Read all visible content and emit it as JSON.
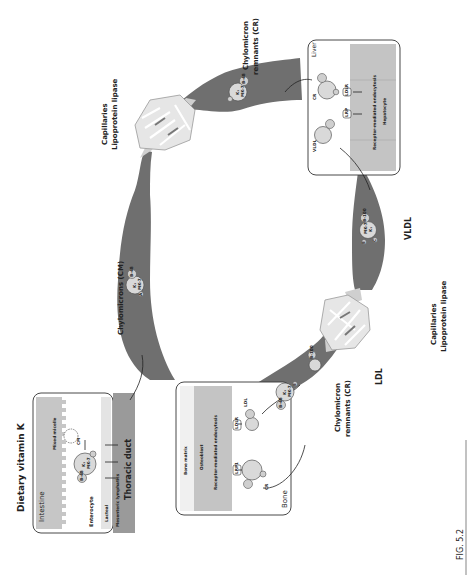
{
  "figure": {
    "caption": "FIG. 5.2",
    "orientation": "rotated 90 degrees counter-clockwise"
  },
  "labels": {
    "dietary": "Dietary vitamin K",
    "intestine": "Intestine",
    "mixed_micelle": "Mixed micelle",
    "cm_small": "CM",
    "enterocyte": "Enterocyte",
    "lacteal": "Lacteal",
    "mesenteric": "Mesenteric lymphatics",
    "thoracic": "Thoracic duct",
    "chylomicrons": "Chylomicrons (CM)",
    "capillaries_top": "Capillaries",
    "lpl_top": "Lipoprotein lipase",
    "cr_top_1": "Chylomicron",
    "cr_top_2": "remnants (CR)",
    "liver": "Liver",
    "liver_cr": "CR",
    "liver_vldl": "VLDL",
    "liver_rme": "Receptor-mediated endocytosis",
    "hepatocyte": "Hepatocyte",
    "lrp": "LRP",
    "ldlr": "LDLR",
    "vldl": "VLDL",
    "capillaries_bottom": "Capillaries",
    "lpl_bottom": "Lipoprotein lipase",
    "ldl": "LDL",
    "cr_bottom_1": "Chylomicron",
    "cr_bottom_2": "remnants (CR)",
    "bone": "Bone",
    "bone_matrix": "Bone matrix",
    "osteoblast": "Osteoblast",
    "bone_rme": "Receptor-mediated endocytosis",
    "bone_cr": "CR",
    "bone_ldl": "LDL",
    "bone_lrp": "LRP1",
    "bone_ldlr": "LDLR"
  },
  "particles": {
    "k1": "K₁",
    "mk7": "MK-7",
    "b48": "B-48",
    "b100": "B-100",
    "a": "A",
    "e": "E",
    "c": "C"
  },
  "colors": {
    "vessel": "#6f6f6f",
    "capillary": "#d8d8d8",
    "cell": "#c4c4c4",
    "particle": "#d9d9d9"
  }
}
